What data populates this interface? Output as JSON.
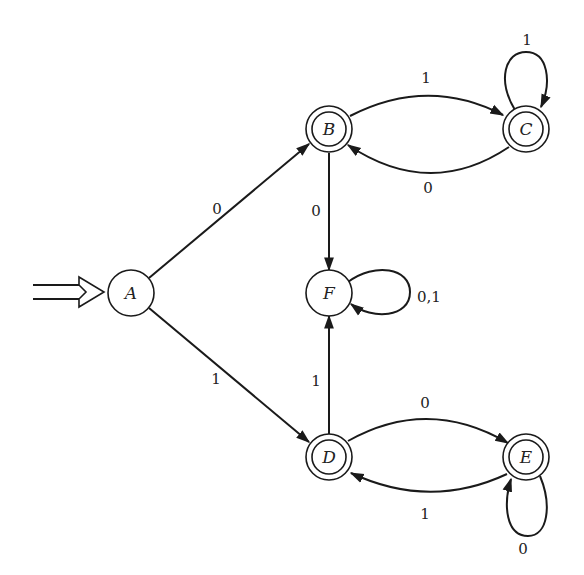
{
  "diagram": {
    "type": "finite-automaton",
    "start_state": "A",
    "states": [
      {
        "id": "A",
        "label": "A",
        "accepting": false,
        "start": true
      },
      {
        "id": "B",
        "label": "B",
        "accepting": true
      },
      {
        "id": "C",
        "label": "C",
        "accepting": true
      },
      {
        "id": "F",
        "label": "F",
        "accepting": false
      },
      {
        "id": "D",
        "label": "D",
        "accepting": true
      },
      {
        "id": "E",
        "label": "E",
        "accepting": true
      }
    ],
    "transitions": [
      {
        "from": "A",
        "to": "B",
        "label": "0"
      },
      {
        "from": "A",
        "to": "D",
        "label": "1"
      },
      {
        "from": "B",
        "to": "C",
        "label": "1"
      },
      {
        "from": "C",
        "to": "B",
        "label": "0"
      },
      {
        "from": "C",
        "to": "C",
        "label": "1"
      },
      {
        "from": "B",
        "to": "F",
        "label": "0"
      },
      {
        "from": "F",
        "to": "F",
        "label": "0,1"
      },
      {
        "from": "D",
        "to": "F",
        "label": "1"
      },
      {
        "from": "D",
        "to": "E",
        "label": "0"
      },
      {
        "from": "E",
        "to": "D",
        "label": "1"
      },
      {
        "from": "E",
        "to": "E",
        "label": "0"
      }
    ]
  }
}
